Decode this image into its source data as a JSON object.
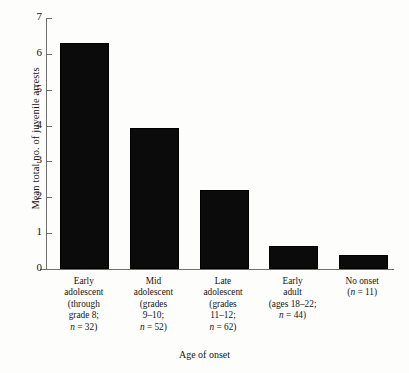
{
  "chart_data": {
    "type": "bar",
    "title": "",
    "xlabel": "Age of onset",
    "ylabel": "Mean total no. of juvenile arrests",
    "categories": [
      "Early adolescent (through grade 8; n = 32)",
      "Mid adolescent (grades 9–10; n = 52)",
      "Late adolescent (grades 11–12; n = 62)",
      "Early adult (ages 18–22; n = 44)",
      "No onset (n = 11)"
    ],
    "category_lines": [
      [
        "Early",
        "adolescent",
        "(through",
        "grade 8;",
        "n = 32)"
      ],
      [
        "Mid",
        "adolescent",
        "(grades",
        "9–10;",
        "n = 52)"
      ],
      [
        "Late",
        "adolescent",
        "(grades",
        "11–12;",
        "n = 62)"
      ],
      [
        "Early",
        "adult",
        "(ages 18–22;",
        "n = 44)"
      ],
      [
        "No onset",
        "(n = 11)"
      ]
    ],
    "values": [
      6.26,
      3.87,
      2.15,
      0.58,
      0.33
    ],
    "sample_sizes": [
      32,
      52,
      62,
      44,
      11
    ],
    "ylim": [
      0,
      7
    ],
    "yticks": [
      0,
      1,
      2,
      3,
      4,
      5,
      6,
      7
    ],
    "ytick_labels": [
      "0",
      "1",
      "2",
      "3",
      "4",
      "5",
      "6",
      "7"
    ],
    "grid": false,
    "legend": false,
    "bar_color": "#0b0b0b",
    "axis_color": "#6f6f6f"
  }
}
